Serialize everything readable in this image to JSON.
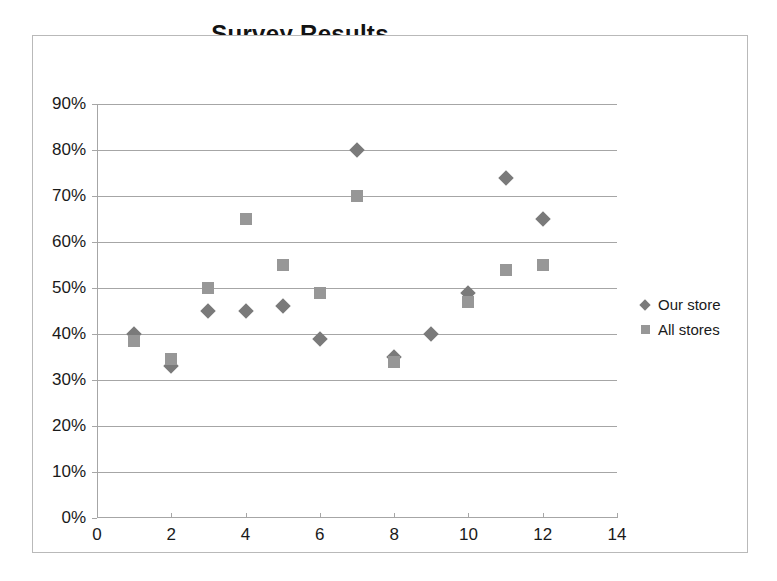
{
  "chart_data": {
    "type": "scatter",
    "title": "Survey Results",
    "xlabel": "",
    "ylabel": "",
    "xlim": [
      0,
      14
    ],
    "ylim": [
      0,
      0.9
    ],
    "grid": true,
    "legend_position": "right",
    "x_ticks": [
      "0",
      "2",
      "4",
      "6",
      "8",
      "10",
      "12",
      "14"
    ],
    "x_tick_values": [
      0,
      2,
      4,
      6,
      8,
      10,
      12,
      14
    ],
    "y_ticks": [
      "0%",
      "10%",
      "20%",
      "30%",
      "40%",
      "50%",
      "60%",
      "70%",
      "80%",
      "90%"
    ],
    "y_tick_values": [
      0,
      10,
      20,
      30,
      40,
      50,
      60,
      70,
      80,
      90
    ],
    "series": [
      {
        "name": "Our store",
        "marker": "diamond",
        "color": "#7a7a7a",
        "x": [
          1,
          2,
          3,
          4,
          5,
          6,
          7,
          8,
          9,
          10,
          11,
          12
        ],
        "values": [
          40,
          33,
          45,
          45,
          46,
          39,
          80,
          35,
          40,
          49,
          74,
          65
        ]
      },
      {
        "name": "All stores",
        "marker": "square",
        "color": "#979797",
        "x": [
          1,
          2,
          3,
          4,
          5,
          6,
          7,
          8,
          10,
          11,
          12
        ],
        "values": [
          38.5,
          34.5,
          50,
          65,
          55,
          49,
          70,
          34,
          47,
          54,
          55
        ]
      }
    ]
  },
  "legend": {
    "items": [
      {
        "label": "Our store",
        "marker": "diamond"
      },
      {
        "label": "All stores",
        "marker": "square"
      }
    ]
  }
}
